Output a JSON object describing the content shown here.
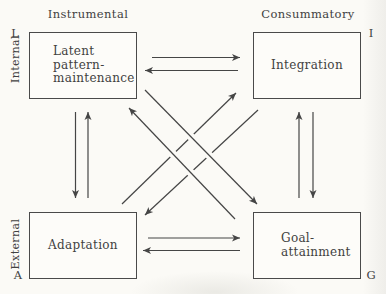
{
  "labels": {
    "top_left_header": "Instrumental",
    "top_right_header": "Consummatory",
    "side_upper": "Internal",
    "side_lower": "External",
    "corner_top_left": "L",
    "corner_top_right": "I",
    "corner_bottom_left": "A",
    "corner_bottom_right": "G"
  },
  "boxes": {
    "latent_pattern_maintenance": {
      "label": "Latent\npattern-\nmaintenance"
    },
    "integration": {
      "label": "Integration"
    },
    "adaptation": {
      "label": "Adaptation"
    },
    "goal_attainment": {
      "label": "Goal-\nattainment"
    }
  },
  "colors": {
    "line": "#454545",
    "text": "#414141",
    "paper": "#fbfaf6",
    "box_border": "#4a4a4a"
  },
  "edges": [
    {
      "name": "lpm-to-integration",
      "from": [
        152,
        57.5
      ],
      "to": [
        240,
        57.5
      ],
      "bridge": false
    },
    {
      "name": "integration-to-lpm",
      "from": [
        238,
        70.5
      ],
      "to": [
        145,
        70.5
      ],
      "bridge": false
    },
    {
      "name": "adaptation-to-goal",
      "from": [
        148,
        238
      ],
      "to": [
        240,
        238
      ],
      "bridge": false
    },
    {
      "name": "goal-to-adaptation",
      "from": [
        240,
        250.5
      ],
      "to": [
        143,
        250.5
      ],
      "bridge": false
    },
    {
      "name": "lpm-to-adaptation",
      "from": [
        75.5,
        112
      ],
      "to": [
        75.5,
        198
      ],
      "bridge": false
    },
    {
      "name": "adaptation-to-lpm",
      "from": [
        88,
        198
      ],
      "to": [
        88,
        112
      ],
      "bridge": false
    },
    {
      "name": "goal-to-integration",
      "from": [
        299,
        198
      ],
      "to": [
        299,
        112
      ],
      "bridge": false
    },
    {
      "name": "integration-to-goal",
      "from": [
        313,
        112
      ],
      "to": [
        313,
        198
      ],
      "bridge": false
    },
    {
      "name": "adaptation-to-integration",
      "from": [
        122,
        204
      ],
      "to": [
        236,
        93
      ],
      "bridge": false
    },
    {
      "name": "integration-to-adaptation",
      "from": [
        258,
        110
      ],
      "to": [
        145,
        215
      ],
      "bridge": false
    },
    {
      "name": "lpm-to-goal",
      "from": [
        145,
        90
      ],
      "to": [
        257,
        204
      ],
      "bridge": true
    },
    {
      "name": "goal-to-lpm",
      "from": [
        235,
        219
      ],
      "to": [
        129,
        108
      ],
      "bridge": true
    }
  ]
}
